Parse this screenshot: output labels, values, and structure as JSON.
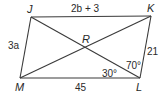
{
  "diagram": {
    "type": "parallelogram",
    "vertices": {
      "J": {
        "label": "J",
        "x": 31,
        "y": 17
      },
      "K": {
        "label": "K",
        "x": 151,
        "y": 16
      },
      "L": {
        "label": "L",
        "x": 140,
        "y": 78
      },
      "M": {
        "label": "M",
        "x": 20,
        "y": 78
      }
    },
    "intersection": {
      "label": "R"
    },
    "sides": {
      "JK": "2b + 3",
      "JM": "3a",
      "KL": "21",
      "ML": "45"
    },
    "angles": {
      "KLJ": "70°",
      "JLM": "30°"
    },
    "colors": {
      "line": "#3a3a3a",
      "text": "#2a2a2a",
      "background": "#ffffff"
    }
  }
}
